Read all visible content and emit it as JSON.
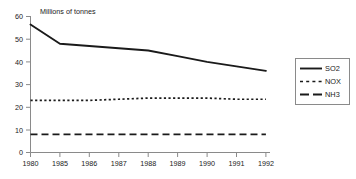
{
  "chart_data": {
    "type": "line",
    "title": "",
    "subtitle": "",
    "xlabel": "",
    "ylabel": "Millions of tonnes",
    "ylabel_position": "top-inside",
    "categories": [
      "1980",
      "1985",
      "1986",
      "1987",
      "1988",
      "1989",
      "1990",
      "1991",
      "1992"
    ],
    "x": [
      1980,
      1985,
      1986,
      1987,
      1988,
      1989,
      1990,
      1991,
      1992
    ],
    "x_spacing": "categorical-equal",
    "ylim": [
      0,
      60
    ],
    "yticks": [
      0,
      10,
      20,
      30,
      40,
      50,
      60
    ],
    "ytick_labels": [
      "0",
      "10",
      "20",
      "30",
      "40",
      "50",
      "60"
    ],
    "grid": false,
    "legend_position": "right",
    "series": [
      {
        "name": "SO2",
        "style": "solid",
        "color": "#1a1a1a",
        "values": [
          56.5,
          48.0,
          47.0,
          46.0,
          45.0,
          42.5,
          40.0,
          38.0,
          36.0
        ]
      },
      {
        "name": "NOX",
        "style": "dotted",
        "color": "#1a1a1a",
        "values": [
          23.0,
          23.0,
          23.0,
          23.5,
          24.0,
          24.0,
          24.0,
          23.5,
          23.5
        ]
      },
      {
        "name": "NH3",
        "style": "dashed",
        "color": "#1a1a1a",
        "values": [
          8.0,
          8.0,
          8.0,
          8.0,
          8.0,
          8.0,
          8.0,
          8.0,
          8.0
        ]
      }
    ]
  },
  "legend": {
    "entries": [
      {
        "label": "SO2",
        "style": "solid"
      },
      {
        "label": "NOX",
        "style": "dotted"
      },
      {
        "label": "NH3",
        "style": "dashed"
      }
    ]
  },
  "axes": {
    "y_axis_label": "Millions of tonnes",
    "y_tick_labels": [
      "60",
      "50",
      "40",
      "30",
      "20",
      "10",
      "0"
    ],
    "x_tick_labels": [
      "1980",
      "1985",
      "1986",
      "1987",
      "1988",
      "1989",
      "1990",
      "1991",
      "1992"
    ]
  },
  "colors": {
    "line": "#1a1a1a",
    "axis": "#8a8a8a",
    "background": "#ffffff",
    "legend_border": "#8a8a8a"
  }
}
